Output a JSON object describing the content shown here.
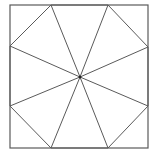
{
  "diagram": {
    "type": "geometric-figure",
    "stroke_color": "#5a5a5a",
    "background": "#ffffff",
    "square": {
      "x1": 10,
      "y1": 5,
      "x2": 148,
      "y2": 148
    },
    "center": {
      "x": 80,
      "y": 77
    },
    "octagon_vertices": [
      {
        "x": 51,
        "y": 5
      },
      {
        "x": 108,
        "y": 5
      },
      {
        "x": 148,
        "y": 47
      },
      {
        "x": 148,
        "y": 106
      },
      {
        "x": 108,
        "y": 148
      },
      {
        "x": 51,
        "y": 148
      },
      {
        "x": 10,
        "y": 106
      },
      {
        "x": 10,
        "y": 46
      }
    ]
  }
}
